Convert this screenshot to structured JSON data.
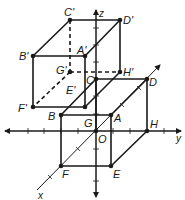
{
  "diagram": {
    "type": "3d-coordinate-translation",
    "axes": {
      "x": {
        "label": "x",
        "from": [
          37,
          190
        ],
        "to": [
          160,
          65
        ]
      },
      "y": {
        "label": "y",
        "from": [
          5,
          131
        ],
        "to": [
          181,
          131
        ]
      },
      "z": {
        "label": "z",
        "from": [
          96,
          197
        ],
        "to": [
          96,
          10
        ]
      },
      "origin_label": "O"
    },
    "ticks": {
      "y_axis_x": [
        28,
        44,
        61,
        78,
        113,
        130,
        164
      ],
      "z_axis_y": [
        28,
        45,
        62,
        96,
        114,
        149,
        181
      ],
      "x_axis_pts": [
        [
          50,
          177
        ],
        [
          78,
          149
        ],
        [
          122,
          105
        ],
        [
          139,
          88
        ]
      ]
    },
    "cube_original": {
      "vertices": {
        "A": [
          111,
          115
        ],
        "B": [
          61,
          115
        ],
        "C": [
          96,
          79
        ],
        "D": [
          147,
          79
        ],
        "E": [
          111,
          166
        ],
        "F": [
          61,
          166
        ],
        "G": [
          96,
          131
        ],
        "H": [
          147,
          131
        ]
      },
      "solid_edges": [
        [
          "A",
          "B"
        ],
        [
          "B",
          "C"
        ],
        [
          "C",
          "D"
        ],
        [
          "D",
          "A"
        ],
        [
          "A",
          "E"
        ],
        [
          "B",
          "F"
        ],
        [
          "D",
          "H"
        ],
        [
          "E",
          "F"
        ],
        [
          "E",
          "H"
        ],
        [
          "C",
          "G"
        ]
      ],
      "labels": [
        {
          "text": "A",
          "x": 114,
          "y": 122
        },
        {
          "text": "B",
          "x": 48,
          "y": 120
        },
        {
          "text": "C",
          "x": 86,
          "y": 84
        },
        {
          "text": "D",
          "x": 149,
          "y": 86
        },
        {
          "text": "E",
          "x": 113,
          "y": 178
        },
        {
          "text": "F",
          "x": 62,
          "y": 178
        },
        {
          "text": "G",
          "x": 84,
          "y": 127
        },
        {
          "text": "H",
          "x": 150,
          "y": 128
        },
        {
          "text": "O",
          "x": 98,
          "y": 143
        }
      ]
    },
    "cube_translated": {
      "vertices": {
        "A'": [
          85,
          56
        ],
        "B'": [
          33,
          56
        ],
        "C'": [
          70,
          20
        ],
        "D'": [
          120,
          20
        ],
        "E'": [
          85,
          107
        ],
        "F'": [
          33,
          107
        ],
        "G'": [
          70,
          72
        ],
        "H'": [
          120,
          72
        ]
      },
      "solid_edges": [
        [
          "A'",
          "B'"
        ],
        [
          "B'",
          "C'"
        ],
        [
          "C'",
          "D'"
        ],
        [
          "D'",
          "A'"
        ],
        [
          "A'",
          "E'"
        ],
        [
          "B'",
          "F'"
        ],
        [
          "D'",
          "H'"
        ],
        [
          "E'",
          "F'"
        ],
        [
          "E'",
          "H'"
        ]
      ],
      "dashed_edges": [
        [
          "C'",
          "G'"
        ],
        [
          "G'",
          "H'"
        ],
        [
          "G'",
          "F'"
        ]
      ],
      "labels": [
        {
          "text": "A'",
          "x": 77,
          "y": 54
        },
        {
          "text": "B'",
          "x": 19,
          "y": 60
        },
        {
          "text": "C'",
          "x": 64,
          "y": 16
        },
        {
          "text": "D'",
          "x": 123,
          "y": 24
        },
        {
          "text": "E'",
          "x": 66,
          "y": 94
        },
        {
          "text": "F'",
          "x": 18,
          "y": 112
        },
        {
          "text": "G'",
          "x": 56,
          "y": 74
        },
        {
          "text": "H'",
          "x": 123,
          "y": 76
        }
      ]
    },
    "colors": {
      "stroke": "#1a1a1a",
      "background": "#ffffff"
    }
  }
}
